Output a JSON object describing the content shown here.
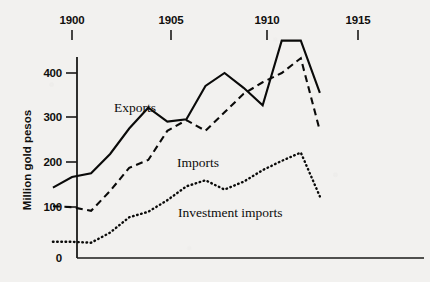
{
  "chart_data": {
    "type": "line",
    "title": "",
    "xlabel": "",
    "ylabel": "Million gold pesos",
    "x": [
      1899,
      1900,
      1901,
      1902,
      1903,
      1904,
      1905,
      1906,
      1907,
      1908,
      1909,
      1910,
      1911,
      1912,
      1913
    ],
    "xlim": [
      1899,
      1914
    ],
    "ylim": [
      0,
      480
    ],
    "x_tick_values": [
      1900,
      1905,
      1910,
      1915
    ],
    "x_tick_labels": [
      "1900",
      "1905",
      "1910",
      "1915"
    ],
    "y_tick_values": [
      0,
      100,
      200,
      300,
      400
    ],
    "y_tick_labels": [
      "0",
      "100",
      "200",
      "300",
      "400"
    ],
    "grid": false,
    "legend": "inline-labels",
    "series": [
      {
        "name": "Exports",
        "style": "solid",
        "label": "Exports",
        "values": [
          152,
          175,
          183,
          225,
          280,
          325,
          295,
          300,
          372,
          400,
          368,
          330,
          470,
          470,
          357
        ]
      },
      {
        "name": "Imports",
        "style": "dashed",
        "label": "Imports",
        "values": [
          112,
          110,
          102,
          145,
          195,
          212,
          275,
          298,
          275,
          315,
          355,
          380,
          400,
          432,
          275
        ]
      },
      {
        "name": "Investment imports",
        "style": "dotted",
        "label": "Investment imports",
        "values": [
          35,
          35,
          33,
          55,
          88,
          100,
          125,
          155,
          168,
          148,
          165,
          190,
          210,
          228,
          133
        ]
      }
    ],
    "annotations": [
      {
        "text": "Exports",
        "x_px": 114,
        "y_px": 112
      },
      {
        "text": "Imports",
        "x_px": 177,
        "y_px": 167
      },
      {
        "text": "Investment imports",
        "x_px": 178,
        "y_px": 217
      }
    ],
    "colors": {
      "ink": "#0a0a09",
      "paper": "#f2f1ef",
      "axis": "#1a1a18"
    }
  }
}
